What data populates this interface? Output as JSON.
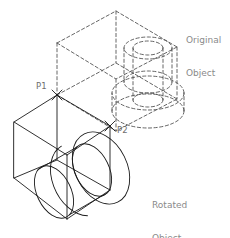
{
  "drawing": {
    "type": "isometric-cad-rotation-illustration",
    "background_color": "#ffffff",
    "solid_line_color": "#1a1a1a",
    "dashed_line_color": "#555555",
    "label_color": "#8a8a8a",
    "point_label_color": "#6e6e6e",
    "canvas": {
      "width": 230,
      "height": 238
    }
  },
  "labels": {
    "original": {
      "line1": "Original",
      "line2": "Object",
      "x": 186,
      "y": 13
    },
    "rotated": {
      "line1": "Rotated",
      "line2": "Object",
      "x": 152,
      "y": 178
    }
  },
  "points": [
    {
      "id": "P1",
      "label": "P1",
      "marker_x": 57,
      "marker_y": 95,
      "label_x": 36,
      "label_y": 82
    },
    {
      "id": "P2",
      "label": "P2",
      "marker_x": 110,
      "marker_y": 126,
      "label_x": 117,
      "label_y": 126
    }
  ],
  "objects": [
    {
      "name": "original-object",
      "style": "dashed",
      "description": "block with cylindrical boss, shown before rotation"
    },
    {
      "name": "rotated-object",
      "style": "solid",
      "description": "same block rotated about the P1-P2 axis"
    }
  ],
  "rotation_axis": {
    "from": "P1",
    "to": "P2"
  }
}
